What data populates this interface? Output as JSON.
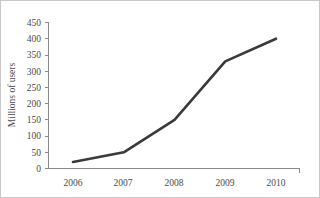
{
  "chart_data": {
    "type": "line",
    "title": "",
    "subtitle": "",
    "xlabel": "",
    "ylabel": "Millions of users",
    "categories": [
      "2006",
      "2007",
      "2008",
      "2009",
      "2010"
    ],
    "x": [
      2006,
      2007,
      2008,
      2009,
      2010
    ],
    "values": [
      20,
      50,
      150,
      330,
      400
    ],
    "series": [
      {
        "name": "Millions of users",
        "values": [
          20,
          50,
          150,
          330,
          400
        ]
      }
    ],
    "ylim": [
      0,
      450
    ],
    "yticks": [
      0,
      50,
      100,
      150,
      200,
      250,
      300,
      350,
      400,
      450
    ],
    "ytick_labels": [
      "0",
      "50",
      "100",
      "150",
      "200",
      "250",
      "300",
      "350",
      "400",
      "450"
    ],
    "xtick_labels": [
      "2006",
      "2007",
      "2008",
      "2009",
      "2010"
    ],
    "grid": false,
    "legend": false,
    "legend_position": "none",
    "annotations": [],
    "colors": {
      "line": "#3a3a3a",
      "axis": "#8a8a8a",
      "text": "#4a4a4a",
      "background": "#ffffff",
      "border": "#c9c9c9"
    }
  }
}
